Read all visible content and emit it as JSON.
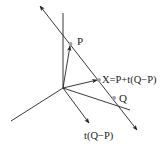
{
  "diagram": {
    "type": "vector-geometry",
    "colors": {
      "line": "#222222",
      "point": "#a0a0a0",
      "background": "#ffffff"
    },
    "labels": {
      "p": "P",
      "x": "X=P+t(Q−P)",
      "q": "Q",
      "direction": "t(Q−P)"
    },
    "points": {
      "origin": [
        63,
        88
      ],
      "P": [
        70,
        44
      ],
      "X": [
        99,
        80
      ],
      "Q": [
        114,
        98
      ]
    },
    "axes": [
      {
        "name": "vertical-axis",
        "from": [
          63,
          88
        ],
        "to": [
          63,
          13
        ]
      },
      {
        "name": "left-axis",
        "from": [
          63,
          88
        ],
        "to": [
          11,
          121
        ]
      },
      {
        "name": "right-axis",
        "from": [
          63,
          88
        ],
        "to": [
          130,
          110
        ]
      }
    ],
    "line": {
      "name": "line-through-P-Q",
      "from": [
        40,
        6
      ],
      "to": [
        137,
        130
      ],
      "arrows": "both"
    },
    "vectors": [
      {
        "name": "vector-to-P",
        "from": [
          63,
          88
        ],
        "to": [
          70,
          45
        ]
      },
      {
        "name": "vector-to-X",
        "from": [
          63,
          88
        ],
        "to": [
          98,
          80
        ]
      },
      {
        "name": "vector-t-Q-minus-P",
        "from": [
          63,
          88
        ],
        "to": [
          89,
          123
        ]
      }
    ]
  }
}
